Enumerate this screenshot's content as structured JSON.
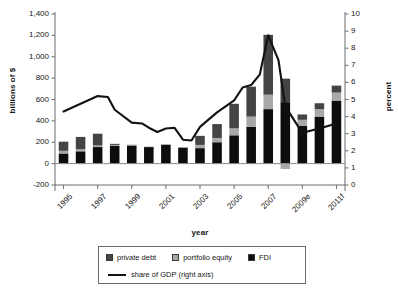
{
  "chart_data": {
    "type": "bar",
    "title": "",
    "subtitle": "",
    "xlabel": "year",
    "ylabel": "billions of $",
    "y2label": "percent",
    "categories": [
      "1995",
      "1996",
      "1997",
      "1998",
      "1999",
      "2000",
      "2001",
      "2002",
      "2003",
      "2004",
      "2005",
      "2006",
      "2007",
      "2008",
      "2009e",
      "2010f",
      "2011f"
    ],
    "tick_labels_x": [
      "1995",
      "",
      "1997",
      "",
      "1999",
      "",
      "2001",
      "",
      "2003",
      "",
      "2005",
      "",
      "2007",
      "",
      "2009e",
      "",
      "2011f"
    ],
    "ylim": [
      -200,
      1400
    ],
    "yticks": [
      "-200",
      "0",
      "200",
      "400",
      "600",
      "800",
      "1,000",
      "1,200",
      "1,400"
    ],
    "y2lim": [
      0,
      10
    ],
    "y2ticks": [
      "0",
      "1",
      "2",
      "3",
      "4",
      "5",
      "6",
      "7",
      "8",
      "9",
      "10"
    ],
    "grid": false,
    "legend_position": "bottom",
    "stacked": true,
    "series": [
      {
        "name": "FDI",
        "color": "#0d0d0d",
        "values": [
          95,
          115,
          155,
          165,
          170,
          155,
          175,
          150,
          145,
          200,
          265,
          345,
          510,
          575,
          355,
          440,
          590
        ]
      },
      {
        "name": "portfolio equity",
        "color": "#a8a8a8",
        "values": [
          25,
          20,
          15,
          10,
          8,
          5,
          8,
          5,
          30,
          40,
          65,
          95,
          135,
          -50,
          55,
          70,
          75
        ]
      },
      {
        "name": "private debt",
        "color": "#444444",
        "values": [
          85,
          115,
          110,
          10,
          0,
          0,
          0,
          0,
          85,
          130,
          230,
          280,
          560,
          220,
          50,
          55,
          65
        ]
      }
    ],
    "line_series": {
      "name": "share of GDP (right axis)",
      "color": "#121212",
      "axis": "right",
      "unit": "percent",
      "values": [
        4.3,
        4.7,
        5.2,
        5.15,
        3.7,
        3.6,
        3.15,
        3.35,
        3.3,
        2.6,
        3.35,
        4.2,
        4.6,
        5.3,
        5.7,
        5.9,
        6.4,
        8.75,
        4.6,
        3.05,
        3.2,
        3.45,
        3.6
      ],
      "points": [
        {
          "x": 1995,
          "y": 4.3
        },
        {
          "x": 1996,
          "y": 4.75
        },
        {
          "x": 1997,
          "y": 5.2
        },
        {
          "x": 1997.6,
          "y": 5.15
        },
        {
          "x": 1998,
          "y": 4.4
        },
        {
          "x": 1999,
          "y": 3.65
        },
        {
          "x": 1999.6,
          "y": 3.6
        },
        {
          "x": 2000,
          "y": 3.35
        },
        {
          "x": 2000.5,
          "y": 3.1
        },
        {
          "x": 2001,
          "y": 3.3
        },
        {
          "x": 2001.5,
          "y": 3.35
        },
        {
          "x": 2002,
          "y": 2.65
        },
        {
          "x": 2002.5,
          "y": 2.6
        },
        {
          "x": 2003,
          "y": 3.4
        },
        {
          "x": 2004,
          "y": 4.25
        },
        {
          "x": 2005,
          "y": 4.95
        },
        {
          "x": 2005.5,
          "y": 5.7
        },
        {
          "x": 2006,
          "y": 5.85
        },
        {
          "x": 2006.5,
          "y": 6.45
        },
        {
          "x": 2007,
          "y": 8.75
        },
        {
          "x": 2007.6,
          "y": 7.3
        },
        {
          "x": 2008,
          "y": 4.6
        },
        {
          "x": 2009,
          "y": 3.05
        },
        {
          "x": 2010,
          "y": 3.3
        },
        {
          "x": 2011,
          "y": 3.6
        }
      ]
    },
    "legend_entries": [
      {
        "label": "private debt",
        "marker": "square",
        "color": "#444444"
      },
      {
        "label": "portfolio equity",
        "marker": "square",
        "color": "#a8a8a8"
      },
      {
        "label": "FDI",
        "marker": "square",
        "color": "#0d0d0d"
      },
      {
        "label": "share of GDP (right axis)",
        "marker": "line",
        "color": "#121212"
      }
    ]
  },
  "axes": {
    "left_title": "billions of $",
    "right_title": "percent",
    "bottom_title": "year"
  },
  "legend": {
    "private_debt": "private debt",
    "portfolio_equity": "portfolio equity",
    "fdi": "FDI",
    "share_of_gdp": "share of GDP (right axis)"
  },
  "colors": {
    "fdi": "#0d0d0d",
    "portfolio_equity": "#a8a8a8",
    "private_debt": "#444444",
    "line": "#121212",
    "axis": "#6d6d6d",
    "background": "#ffffff"
  }
}
